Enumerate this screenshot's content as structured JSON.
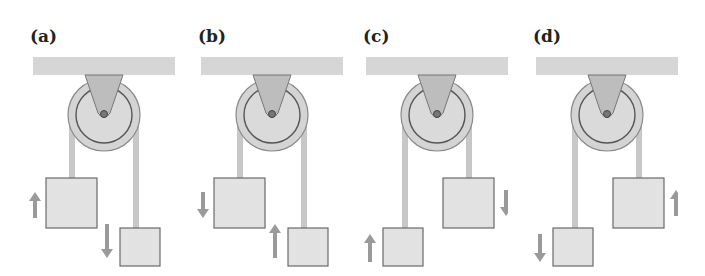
{
  "figure": {
    "panels": [
      {
        "id": "a",
        "label": "(a)",
        "offset_x": 0,
        "left_block_arrow": "up",
        "right_block_arrow": "down",
        "left_block": "large",
        "left_high": true
      },
      {
        "id": "b",
        "label": "(b)",
        "offset_x": 168,
        "left_block_arrow": "down",
        "right_block_arrow": "up",
        "left_block": "large",
        "left_high": true
      },
      {
        "id": "c",
        "label": "(c)",
        "offset_x": 333,
        "left_block_arrow": "up",
        "right_block_arrow": "down",
        "left_block": "small",
        "left_high": false
      },
      {
        "id": "d",
        "label": "(d)",
        "offset_x": 503,
        "left_block_arrow": "down",
        "right_block_arrow": "up",
        "left_block": "small",
        "left_high": false
      }
    ],
    "colors": {
      "ceiling": "#d6d6d6",
      "pulley": "#d4d4d4",
      "pulley_outline": "#8a8a8a",
      "bracket": "#bdbdbd",
      "rope": "#c8c8c8",
      "block": "#e2e2e2",
      "block_outline": "#6a6a6a",
      "arrow": "#9a9a9a"
    }
  }
}
